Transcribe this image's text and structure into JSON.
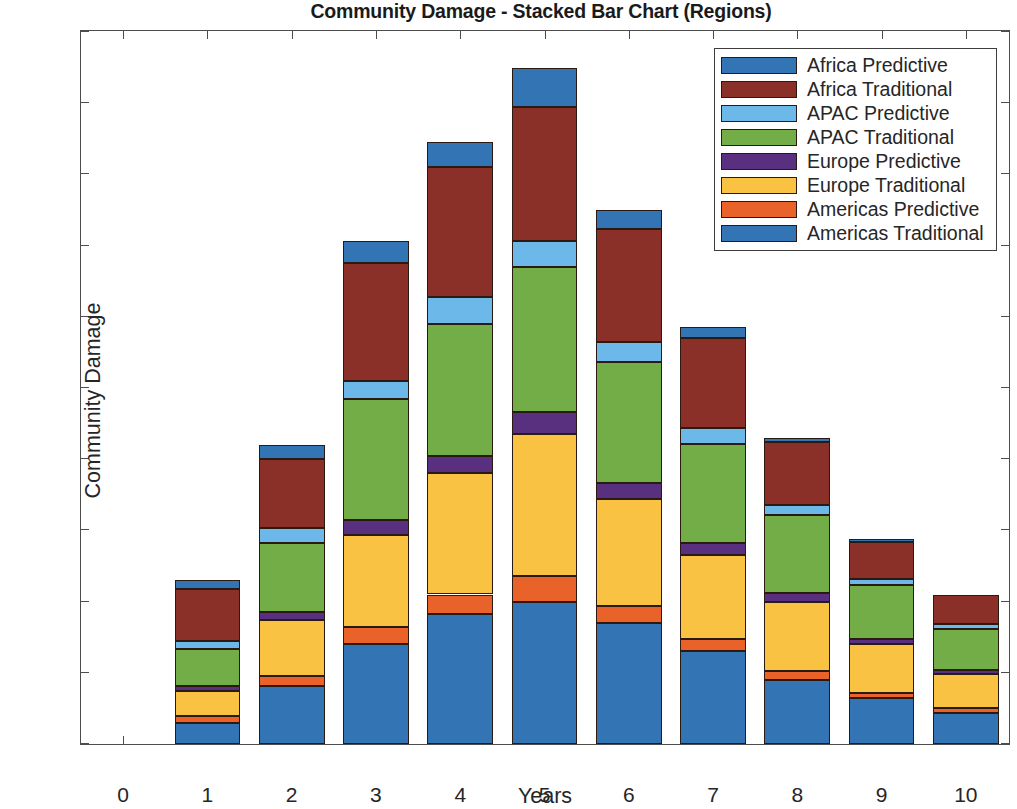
{
  "chart_data": {
    "type": "bar",
    "stacked": true,
    "title": "Community Damage - Stacked Bar Chart (Regions)",
    "xlabel": "Years",
    "ylabel": "Community Damage",
    "categories": [
      1,
      2,
      3,
      4,
      5,
      6,
      7,
      8,
      9,
      10
    ],
    "x_tick_labels": [
      "0",
      "1",
      "2",
      "3",
      "4",
      "5",
      "6",
      "7",
      "8",
      "9",
      "10"
    ],
    "y_tick_labels": [
      "0",
      "0.5",
      "1",
      "1.5",
      "2",
      "2.5",
      "3",
      "3.5",
      "4",
      "4.5",
      "5"
    ],
    "xlim": [
      -0.5,
      10.5
    ],
    "ylim": [
      0,
      5
    ],
    "grid": false,
    "legend_position": "upper right",
    "stack_order_bottom_to_top": [
      "Americas Traditional",
      "Americas Predictive",
      "Europe Traditional",
      "Europe Predictive",
      "APAC Traditional",
      "APAC Predictive",
      "Africa Traditional",
      "Africa Predictive"
    ],
    "series": [
      {
        "name": "Africa Predictive",
        "color": "#3274b4",
        "values": [
          0.06,
          0.1,
          0.15,
          0.18,
          0.28,
          0.13,
          0.08,
          0.03,
          0.02,
          0.0
        ]
      },
      {
        "name": "Africa Traditional",
        "color": "#8b3029",
        "values": [
          0.37,
          0.48,
          0.83,
          0.91,
          0.94,
          0.8,
          0.63,
          0.44,
          0.26,
          0.21
        ]
      },
      {
        "name": "APAC Predictive",
        "color": "#6cb8e8",
        "values": [
          0.05,
          0.11,
          0.13,
          0.19,
          0.18,
          0.14,
          0.11,
          0.07,
          0.04,
          0.03
        ]
      },
      {
        "name": "APAC Traditional",
        "color": "#72ad47",
        "values": [
          0.26,
          0.48,
          0.85,
          0.93,
          1.02,
          0.85,
          0.7,
          0.55,
          0.38,
          0.29
        ]
      },
      {
        "name": "Europe Predictive",
        "color": "#59307f",
        "values": [
          0.04,
          0.06,
          0.1,
          0.12,
          0.15,
          0.11,
          0.08,
          0.06,
          0.04,
          0.03
        ]
      },
      {
        "name": "Europe Traditional",
        "color": "#f9c242",
        "values": [
          0.17,
          0.39,
          0.65,
          0.85,
          1.0,
          0.75,
          0.59,
          0.49,
          0.34,
          0.24
        ]
      },
      {
        "name": "Americas Predictive",
        "color": "#e8622a",
        "values": [
          0.05,
          0.07,
          0.12,
          0.14,
          0.18,
          0.12,
          0.09,
          0.06,
          0.04,
          0.03
        ]
      },
      {
        "name": "Americas Traditional",
        "color": "#3274b4",
        "values": [
          0.15,
          0.41,
          0.7,
          0.91,
          1.0,
          0.85,
          0.65,
          0.45,
          0.32,
          0.22
        ]
      }
    ],
    "totals": [
      1.15,
      2.1,
      3.53,
      4.23,
      4.75,
      3.75,
      2.93,
      2.15,
      1.44,
      1.05
    ]
  },
  "legend": {
    "items": [
      {
        "label": "Africa Predictive",
        "color": "#3274b4"
      },
      {
        "label": "Africa Traditional",
        "color": "#8b3029"
      },
      {
        "label": "APAC Predictive",
        "color": "#6cb8e8"
      },
      {
        "label": "APAC Traditional",
        "color": "#72ad47"
      },
      {
        "label": "Europe Predictive",
        "color": "#59307f"
      },
      {
        "label": "Europe Traditional",
        "color": "#f9c242"
      },
      {
        "label": "Americas Predictive",
        "color": "#e8622a"
      },
      {
        "label": "Americas Traditional",
        "color": "#3274b4"
      }
    ]
  }
}
